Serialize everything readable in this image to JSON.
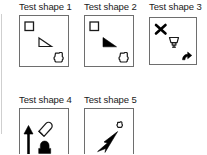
{
  "figure": {
    "background_color": "#ffffff",
    "stroke_color": "#1a1a1a",
    "fill_color": "#000000",
    "box_border_color": "#6e6e6e",
    "rule_color": "#cfcfcf"
  },
  "panels": [
    {
      "id": "test-shape-1",
      "title": "Test shape 1",
      "shapes": [
        {
          "name": "square-outline",
          "style": "outline"
        },
        {
          "name": "right-triangle-outline",
          "style": "outline"
        },
        {
          "name": "rounded-cross-outline",
          "style": "outline"
        }
      ]
    },
    {
      "id": "test-shape-2",
      "title": "Test shape 2",
      "shapes": [
        {
          "name": "square-outline",
          "style": "outline"
        },
        {
          "name": "right-triangle-filled",
          "style": "filled"
        },
        {
          "name": "rounded-cross-outline",
          "style": "outline"
        }
      ]
    },
    {
      "id": "test-shape-3",
      "title": "Test shape 3",
      "shapes": [
        {
          "name": "x-mark-filled",
          "style": "filled"
        },
        {
          "name": "lamp-outline",
          "style": "outline"
        },
        {
          "name": "curved-arrow-filled",
          "style": "filled"
        }
      ]
    },
    {
      "id": "test-shape-4",
      "title": "Test shape 4",
      "shapes": [
        {
          "name": "up-arrow-filled",
          "style": "filled"
        },
        {
          "name": "diagonal-marker-outline",
          "style": "outline"
        },
        {
          "name": "pentagon-blob-filled",
          "style": "filled"
        }
      ]
    },
    {
      "id": "test-shape-5",
      "title": "Test shape 5",
      "shapes": [
        {
          "name": "small-rounded-cross-outline",
          "style": "outline"
        },
        {
          "name": "dart-arrow-filled",
          "style": "filled"
        }
      ]
    }
  ]
}
